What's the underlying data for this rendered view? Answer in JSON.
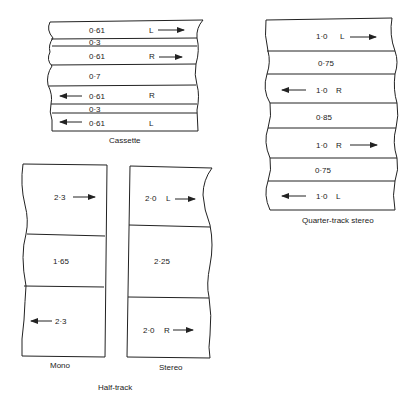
{
  "diagrams": {
    "cassette": {
      "caption": "Cassette",
      "bands": [
        {
          "value": "0·61",
          "channel": "L",
          "arrow": "right"
        },
        {
          "value": "0·3",
          "channel": "",
          "arrow": ""
        },
        {
          "value": "0·61",
          "channel": "R",
          "arrow": "right"
        },
        {
          "value": "0·7",
          "channel": "",
          "arrow": ""
        },
        {
          "value": "0·61",
          "channel": "R",
          "arrow": "left"
        },
        {
          "value": "0·3",
          "channel": "",
          "arrow": ""
        },
        {
          "value": "0·61",
          "channel": "L",
          "arrow": "left"
        }
      ]
    },
    "quarter_track": {
      "caption": "Quarter-track stereo",
      "bands": [
        {
          "value": "1·0",
          "channel": "L",
          "arrow": "right"
        },
        {
          "value": "0·75",
          "channel": "",
          "arrow": ""
        },
        {
          "value": "1·0",
          "channel": "R",
          "arrow": "left"
        },
        {
          "value": "0·85",
          "channel": "",
          "arrow": ""
        },
        {
          "value": "1·0",
          "channel": "R",
          "arrow": "right"
        },
        {
          "value": "0·75",
          "channel": "",
          "arrow": ""
        },
        {
          "value": "1·0",
          "channel": "L",
          "arrow": "left"
        }
      ]
    },
    "half_track": {
      "caption": "Half-track",
      "mono": {
        "caption": "Mono",
        "bands": [
          {
            "value": "2·3",
            "arrow": "right"
          },
          {
            "value": "1·65",
            "arrow": ""
          },
          {
            "value": "2·3",
            "arrow": "left"
          }
        ]
      },
      "stereo": {
        "caption": "Stereo",
        "bands": [
          {
            "value": "2·0",
            "channel": "L",
            "arrow": "right"
          },
          {
            "value": "2·25",
            "channel": "",
            "arrow": ""
          },
          {
            "value": "2·0",
            "channel": "R",
            "arrow": "right"
          }
        ]
      }
    }
  }
}
